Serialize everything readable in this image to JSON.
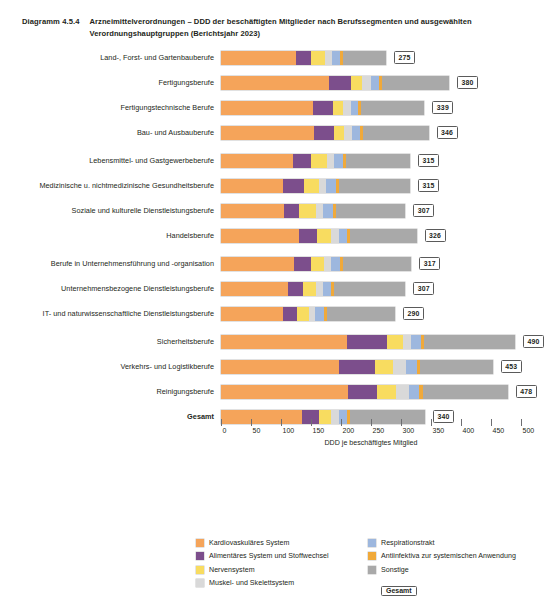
{
  "header": {
    "figure_number": "Diagramm 4.5.4",
    "title_line1": "Arzneimittelverordnungen – DDD der beschäftigten Mitglieder nach Berufssegmenten und ausgewählten",
    "title_line2": "Verordnungshauptgruppen (Berichtsjahr 2023)"
  },
  "chart_data": {
    "type": "bar",
    "orientation": "horizontal",
    "stacked": true,
    "title": "Arzneimittelverordnungen – DDD der beschäftigten Mitglieder nach Berufssegmenten und ausgewählten Verordnungshauptgruppen (Berichtsjahr 2023)",
    "xlabel": "DDD je beschäftigtes Mitglied",
    "ylabel": "",
    "xlim": [
      0,
      500
    ],
    "xticks": [
      0,
      50,
      100,
      150,
      200,
      250,
      300,
      350,
      400,
      450,
      500
    ],
    "grid": false,
    "legend_position": "bottom",
    "categories": [
      "Land-, Forst- und Gartenbauberufe",
      "Fertigungsberufe",
      "Fertigungstechnische Berufe",
      "Bau- und Ausbauberufe",
      "Lebensmittel- und Gastgewerbeberufe",
      "Medizinische u. nichtmedizinische Gesundheitsberufe",
      "Soziale und kulturelle Dienstleistungsberufe",
      "Handelsberufe",
      "Berufe in Unternehmensführung und -organisation",
      "Unternehmensbezogene Dienstleistungsberufe",
      "IT- und naturwissenschaftliche Dienstleistungsberufe",
      "Sicherheitsberufe",
      "Verkehrs- und Logistikberufe",
      "Reinigungsberufe",
      "Gesamt"
    ],
    "series": [
      {
        "name": "Kardiovaskuläres System",
        "color": "#F5A45A",
        "values": [
          125,
          180,
          154,
          155,
          120,
          103,
          105,
          130,
          122,
          112,
          104,
          210,
          196,
          212,
          135
        ]
      },
      {
        "name": "Alimentäres System und Stoffwechsel",
        "color": "#7C4E8C",
        "values": [
          25,
          37,
          32,
          33,
          30,
          35,
          25,
          30,
          28,
          25,
          22,
          67,
          60,
          48,
          28
        ]
      },
      {
        "name": "Nervensystem",
        "color": "#F8DC60",
        "values": [
          23,
          18,
          17,
          17,
          26,
          26,
          29,
          24,
          22,
          22,
          21,
          26,
          30,
          32,
          21
        ]
      },
      {
        "name": "Muskel- und Skelettsystem",
        "color": "#D9D9D9",
        "values": [
          12,
          15,
          14,
          14,
          13,
          11,
          11,
          12,
          12,
          11,
          10,
          14,
          22,
          22,
          12
        ]
      },
      {
        "name": "Respirationstrakt",
        "color": "#9DB7DE",
        "values": [
          13,
          13,
          12,
          12,
          14,
          16,
          16,
          14,
          14,
          14,
          14,
          16,
          18,
          16,
          14
        ]
      },
      {
        "name": "Antiinfektiva zur systemischen Anwendung",
        "color": "#F0A93A",
        "values": [
          5,
          5,
          5,
          5,
          5,
          6,
          6,
          5,
          5,
          5,
          5,
          6,
          6,
          6,
          5
        ]
      },
      {
        "name": "Sonstige",
        "color": "#A9A9A9",
        "values": [
          72,
          112,
          105,
          110,
          107,
          118,
          115,
          111,
          114,
          118,
          114,
          151,
          121,
          142,
          125
        ]
      }
    ],
    "totals": [
      275,
      380,
      339,
      346,
      315,
      315,
      307,
      326,
      317,
      307,
      290,
      490,
      453,
      478,
      340
    ],
    "total_badge_label": "Gesamt"
  },
  "legend": {
    "column1": [
      "Kardiovaskuläres System",
      "Alimentäres System und Stoffwechsel",
      "Nervensystem",
      "Muskel- und Skelettsystem"
    ],
    "column2": [
      "Respirationstrakt",
      "Antiinfektiva zur systemischen Anwendung",
      "Sonstige"
    ],
    "total_label": "Gesamt"
  }
}
